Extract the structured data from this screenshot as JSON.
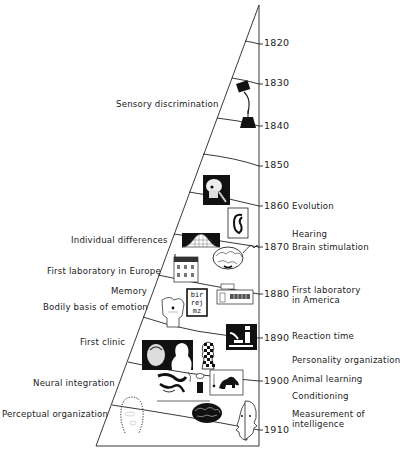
{
  "figure": {
    "type": "timeline-wedge"
  },
  "years": [
    {
      "label": "1820",
      "y": 43
    },
    {
      "label": "1830",
      "y": 83
    },
    {
      "label": "1840",
      "y": 126
    },
    {
      "label": "1850",
      "y": 165
    },
    {
      "label": "1860",
      "y": 206
    },
    {
      "label": "1870",
      "y": 247
    },
    {
      "label": "1880",
      "y": 294
    },
    {
      "label": "1890",
      "y": 338
    },
    {
      "label": "1900",
      "y": 381
    },
    {
      "label": "1910",
      "y": 430
    }
  ],
  "left_labels": [
    {
      "text": "Sensory discrimination",
      "x": 116,
      "y": 99
    },
    {
      "text": "Individual differences",
      "x": 71,
      "y": 235
    },
    {
      "text": "First laboratory in Europe",
      "x": 47,
      "y": 266
    },
    {
      "text": "Memory",
      "x": 111,
      "y": 286
    },
    {
      "text": "Bodily basis of emotion",
      "x": 43,
      "y": 302
    },
    {
      "text": "First clinic",
      "x": 80,
      "y": 337
    },
    {
      "text": "Neural integration",
      "x": 33,
      "y": 378
    },
    {
      "text": "Perceptual organization",
      "x": 2,
      "y": 409
    }
  ],
  "right_labels": [
    {
      "text": "Evolution",
      "x": 292,
      "y": 201
    },
    {
      "text": "Hearing",
      "x": 292,
      "y": 229
    },
    {
      "text": "Brain stimulation",
      "x": 292,
      "y": 242
    },
    {
      "text": "First laboratory",
      "x": 292,
      "y": 285
    },
    {
      "text": "in America",
      "x": 292,
      "y": 295
    },
    {
      "text": "Reaction time",
      "x": 292,
      "y": 331
    },
    {
      "text": "Personality organization",
      "x": 292,
      "y": 355
    },
    {
      "text": "Animal learning",
      "x": 292,
      "y": 374
    },
    {
      "text": "Conditioning",
      "x": 292,
      "y": 391
    },
    {
      "text": "Measurement of",
      "x": 292,
      "y": 409
    },
    {
      "text": "intelligence",
      "x": 292,
      "y": 419
    }
  ],
  "pictograms": [
    "hand-weight-icon",
    "skull-icon",
    "ear-icon",
    "bell-curve-icon",
    "brain-icon",
    "building-icon",
    "letter-chart-icon",
    "torso-icon",
    "laboratory-icon",
    "reaction-apparatus-icon",
    "portrait-icon",
    "chess-pawn-icon",
    "neurons-icon",
    "lion-icon",
    "dotted-head-icon",
    "brain-dark-icon",
    "double-face-icon"
  ],
  "letter_chart": {
    "row1": "bir",
    "row2": "rej",
    "row3": "mz"
  }
}
